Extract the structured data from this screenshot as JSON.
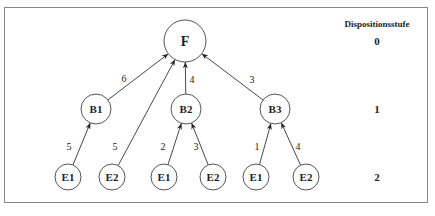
{
  "diagram": {
    "type": "bill-of-materials-tree",
    "legend_title": "Dispositionsstufe",
    "levels": [
      {
        "label": "0",
        "y": 41
      },
      {
        "label": "1",
        "y": 109
      },
      {
        "label": "2",
        "y": 177
      }
    ],
    "nodes": [
      {
        "id": "F",
        "label": "F",
        "level": 0,
        "x": 185,
        "y": 41,
        "r": 21
      },
      {
        "id": "B1",
        "label": "B1",
        "level": 1,
        "x": 96,
        "y": 109,
        "r": 15
      },
      {
        "id": "B2",
        "label": "B2",
        "level": 1,
        "x": 186,
        "y": 109,
        "r": 15
      },
      {
        "id": "B3",
        "label": "B3",
        "level": 1,
        "x": 275,
        "y": 109,
        "r": 15
      },
      {
        "id": "E1a",
        "label": "E1",
        "level": 2,
        "x": 68,
        "y": 177,
        "r": 13
      },
      {
        "id": "E2a",
        "label": "E2",
        "level": 2,
        "x": 112,
        "y": 177,
        "r": 13
      },
      {
        "id": "E1b",
        "label": "E1",
        "level": 2,
        "x": 164,
        "y": 177,
        "r": 13
      },
      {
        "id": "E2b",
        "label": "E2",
        "level": 2,
        "x": 213,
        "y": 177,
        "r": 13
      },
      {
        "id": "E1c",
        "label": "E1",
        "level": 2,
        "x": 256,
        "y": 177,
        "r": 13
      },
      {
        "id": "E2c",
        "label": "E2",
        "level": 2,
        "x": 306,
        "y": 177,
        "r": 13
      }
    ],
    "edges": [
      {
        "from": "B1",
        "to": "F",
        "qty": "6",
        "lx": 124,
        "ly": 78
      },
      {
        "from": "E2a",
        "to": "F",
        "qty": "5",
        "lx": 115,
        "ly": 146
      },
      {
        "from": "B2",
        "to": "F",
        "qty": "4",
        "lx": 192,
        "ly": 79
      },
      {
        "from": "B3",
        "to": "F",
        "qty": "3",
        "lx": 252,
        "ly": 79
      },
      {
        "from": "E1a",
        "to": "B1",
        "qty": "5",
        "lx": 69,
        "ly": 146
      },
      {
        "from": "E1b",
        "to": "B2",
        "qty": "2",
        "lx": 163,
        "ly": 146
      },
      {
        "from": "E2b",
        "to": "B2",
        "qty": "3",
        "lx": 196,
        "ly": 146
      },
      {
        "from": "E1c",
        "to": "B3",
        "qty": "1",
        "lx": 257,
        "ly": 146
      },
      {
        "from": "E2c",
        "to": "B3",
        "qty": "4",
        "lx": 298,
        "ly": 146
      }
    ]
  }
}
